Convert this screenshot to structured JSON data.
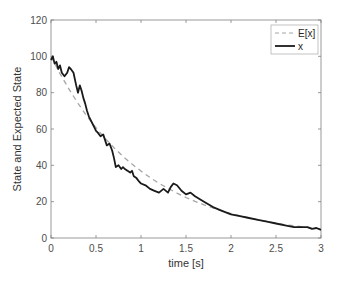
{
  "chart_data": {
    "type": "line",
    "title": "",
    "xlabel": "time [s]",
    "ylabel": "State and Expected State",
    "xlim": [
      0,
      3
    ],
    "ylim": [
      0,
      120
    ],
    "xticks": [
      0,
      0.5,
      1,
      1.5,
      2,
      2.5,
      3
    ],
    "xtick_labels": [
      "0",
      "0.5",
      "1",
      "1.5",
      "2",
      "2.5",
      "3"
    ],
    "yticks": [
      0,
      20,
      40,
      60,
      80,
      100,
      120
    ],
    "ytick_labels": [
      "0",
      "20",
      "40",
      "60",
      "80",
      "100",
      "120"
    ],
    "grid": false,
    "legend_position": "upper right",
    "series": [
      {
        "name": "E[x]",
        "style": "dashed",
        "color": "#a6a6a6",
        "x": [
          0,
          0.1,
          0.2,
          0.3,
          0.4,
          0.5,
          0.6,
          0.7,
          0.8,
          0.9,
          1.0,
          1.1,
          1.2,
          1.3,
          1.4,
          1.5,
          1.6,
          1.7,
          1.8,
          1.9,
          2.0,
          2.1,
          2.2,
          2.3,
          2.4,
          2.5,
          2.6,
          2.7,
          2.8,
          2.9,
          3.0
        ],
        "values": [
          100,
          90.5,
          81.9,
          74.1,
          67.0,
          60.7,
          54.9,
          49.7,
          44.9,
          40.7,
          36.8,
          33.3,
          30.1,
          27.3,
          24.7,
          22.3,
          20.2,
          18.3,
          16.5,
          15.0,
          13.5,
          12.2,
          11.1,
          10.0,
          9.1,
          8.2,
          7.4,
          6.7,
          6.1,
          5.5,
          5.0
        ]
      },
      {
        "name": "x",
        "style": "solid",
        "color": "#1a1a1a",
        "x": [
          0,
          0.02,
          0.04,
          0.06,
          0.08,
          0.1,
          0.12,
          0.15,
          0.18,
          0.2,
          0.22,
          0.25,
          0.28,
          0.3,
          0.32,
          0.34,
          0.36,
          0.38,
          0.4,
          0.42,
          0.44,
          0.46,
          0.48,
          0.5,
          0.52,
          0.55,
          0.58,
          0.6,
          0.62,
          0.65,
          0.68,
          0.7,
          0.72,
          0.75,
          0.78,
          0.8,
          0.82,
          0.85,
          0.88,
          0.9,
          0.92,
          0.95,
          0.98,
          1.0,
          1.05,
          1.1,
          1.15,
          1.2,
          1.25,
          1.3,
          1.33,
          1.36,
          1.4,
          1.45,
          1.5,
          1.55,
          1.6,
          1.7,
          1.8,
          1.9,
          2.0,
          2.1,
          2.2,
          2.3,
          2.4,
          2.5,
          2.6,
          2.7,
          2.8,
          2.85,
          2.9,
          2.95,
          3.0
        ],
        "values": [
          98,
          100,
          96,
          97,
          93,
          95,
          91,
          89,
          91,
          94,
          93,
          91,
          84,
          80,
          84,
          81,
          77,
          74,
          70,
          67,
          65,
          63,
          61,
          59,
          58,
          56,
          57,
          54,
          51,
          52,
          48,
          44,
          39,
          40,
          38,
          39,
          38,
          37,
          36,
          37,
          34,
          33,
          31,
          30,
          29,
          27,
          26,
          25,
          27,
          25,
          28,
          30,
          29,
          26,
          24,
          25,
          23,
          20,
          17,
          15,
          13,
          12,
          11,
          10,
          9,
          8,
          7,
          6,
          6,
          6,
          5,
          5.5,
          4.5
        ]
      }
    ]
  },
  "legend": {
    "items": [
      {
        "label": "E[x]",
        "style": "dashed"
      },
      {
        "label": "x",
        "style": "solid"
      }
    ]
  },
  "colors": {
    "axis": "#808080",
    "expected": "#a6a6a6",
    "state": "#1a1a1a"
  }
}
